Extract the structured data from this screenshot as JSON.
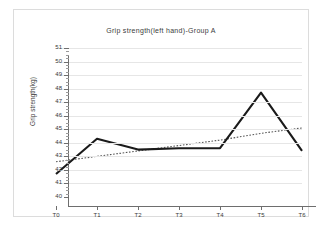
{
  "chart_data": {
    "type": "line",
    "title": "Grip strength(left hand)-Group A",
    "xlabel": "",
    "ylabel": "Grip strength(kg)",
    "categories": [
      "T0",
      "T1",
      "T2",
      "T3",
      "T4",
      "T5",
      "T6"
    ],
    "ylim": [
      40,
      51
    ],
    "ytick_labels": [
      "40",
      "41",
      "42",
      "43",
      "44",
      "45",
      "46",
      "47",
      "48",
      "49",
      "50",
      "51"
    ],
    "ytick_values": [
      40,
      41,
      42,
      43,
      44,
      45,
      46,
      47,
      48,
      49,
      50,
      51
    ],
    "grid": true,
    "legend": "none",
    "series": [
      {
        "name": "Grip strength (left hand)",
        "style": "solid",
        "color": "#1a1a1a",
        "values": [
          41.7,
          44.3,
          43.5,
          43.6,
          43.6,
          47.7,
          43.4
        ]
      },
      {
        "name": "Trend line",
        "style": "dotted",
        "color": "#555555",
        "values": [
          42.6,
          43.0,
          43.4,
          43.8,
          44.2,
          44.7,
          45.1
        ]
      }
    ]
  },
  "axes": {
    "y_title": "Grip strength(kg)"
  }
}
